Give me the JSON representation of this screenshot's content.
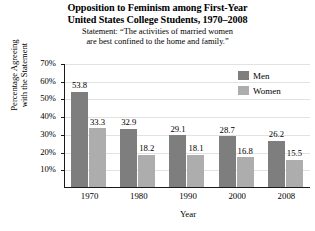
{
  "title": {
    "line1": "Opposition to Feminism among First-Year",
    "line2": "United States College Students, 1970–2008"
  },
  "subtitle": {
    "line1": "Statement: “The activities of married women",
    "line2": "are best confined to the home and family.”"
  },
  "axes": {
    "ylabel_line1": "Percentage Agreeing",
    "ylabel_line2": "with the Statement",
    "xlabel": "Year"
  },
  "legend": {
    "men": "Men",
    "women": "Women"
  },
  "colors": {
    "men": "#7e7e7e",
    "women": "#adadad",
    "axis": "#1a1a1a",
    "grid": "#e2e2e2",
    "background": "#ffffff"
  },
  "yticks": [
    "10%",
    "20%",
    "30%",
    "40%",
    "50%",
    "60%",
    "70%"
  ],
  "xticks": [
    "1970",
    "1980",
    "1990",
    "2000",
    "2008"
  ],
  "values": {
    "men": [
      "53.8",
      "32.9",
      "29.1",
      "28.7",
      "26.2"
    ],
    "women": [
      "33.3",
      "18.2",
      "18.1",
      "16.8",
      "15.5"
    ]
  },
  "chart_data": {
    "type": "bar",
    "title": "Opposition to Feminism among First-Year United States College Students, 1970–2008",
    "subtitle": "Statement: “The activities of married women are best confined to the home and family.”",
    "xlabel": "Year",
    "ylabel": "Percentage Agreeing with the Statement",
    "categories": [
      "1970",
      "1980",
      "1990",
      "2000",
      "2008"
    ],
    "series": [
      {
        "name": "Men",
        "values": [
          53.8,
          32.9,
          29.1,
          28.7,
          26.2
        ],
        "color": "#7e7e7e"
      },
      {
        "name": "Women",
        "values": [
          33.3,
          18.2,
          18.1,
          16.8,
          15.5
        ],
        "color": "#adadad"
      }
    ],
    "ylim": [
      0,
      70
    ],
    "ytick_values": [
      10,
      20,
      30,
      40,
      50,
      60,
      70
    ],
    "ytick_labels": [
      "10%",
      "20%",
      "30%",
      "40%",
      "50%",
      "60%",
      "70%"
    ],
    "grid": "horizontal",
    "legend_position": "top-right",
    "data_labels": true
  }
}
